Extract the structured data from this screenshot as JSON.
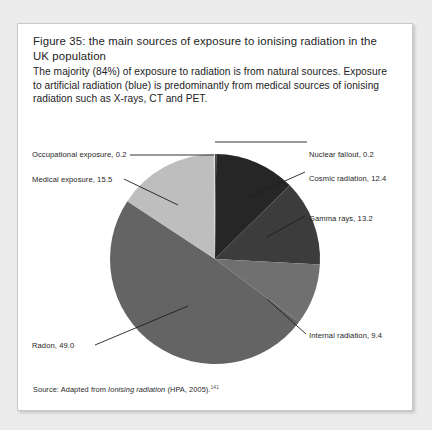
{
  "figure": {
    "title": "Figure 35: the main sources of exposure to ionising radiation in the UK population",
    "description": "The majority (84%) of exposure to radiation is from natural sources. Exposure to artificial radiation (blue) is predominantly from medical sources of ionising radiation such as X-rays, CT and PET.",
    "source_prefix": "Source: Adapted from ",
    "source_italic": "Ionising radiation",
    "source_suffix": " (HPA, 2005).",
    "source_footnote_marker": "141"
  },
  "chart_data": {
    "type": "pie",
    "title": "The main sources of exposure to ionising radiation in the UK population",
    "unit": "percent",
    "start_angle_deg": 0,
    "direction": "clockwise",
    "legend": "callout-labels",
    "categories": [
      "Nuclear fallout",
      "Cosmic radiation",
      "Gamma rays",
      "Internal radiation",
      "Radon",
      "Medical exposure",
      "Occupational exposure"
    ],
    "values": [
      0.2,
      12.4,
      13.2,
      9.4,
      49.0,
      15.5,
      0.2
    ],
    "colors": [
      "#4f4f4f",
      "#262626",
      "#3c3c3c",
      "#707070",
      "#646464",
      "#bebebe",
      "#d8d8d8"
    ],
    "slices": [
      {
        "label": "Nuclear fallout, 0.2",
        "name": "Nuclear fallout",
        "value": 0.2,
        "color": "#4f4f4f"
      },
      {
        "label": "Cosmic radiation, 12.4",
        "name": "Cosmic radiation",
        "value": 12.4,
        "color": "#262626"
      },
      {
        "label": "Gamma rays, 13.2",
        "name": "Gamma rays",
        "value": 13.2,
        "color": "#3c3c3c"
      },
      {
        "label": "Internal radiation, 9.4",
        "name": "Internal radiation",
        "value": 9.4,
        "color": "#707070"
      },
      {
        "label": "Radon, 49.0",
        "name": "Radon",
        "value": 49.0,
        "color": "#646464"
      },
      {
        "label": "Medical exposure, 15.5",
        "name": "Medical exposure",
        "value": 15.5,
        "color": "#bebebe"
      },
      {
        "label": "Occupational exposure, 0.2",
        "name": "Occupational exposure",
        "value": 0.2,
        "color": "#d8d8d8"
      }
    ]
  }
}
